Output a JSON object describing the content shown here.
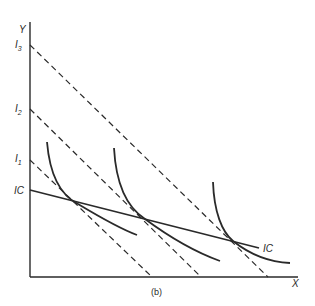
{
  "figure": {
    "caption": "(b)",
    "axes": {
      "y_label": "Y",
      "x_label": "X"
    },
    "budget_lines": [
      {
        "label": "I",
        "sub": "1",
        "y_intercept": 160,
        "x_intercept": 152
      },
      {
        "label": "I",
        "sub": "2",
        "y_intercept": 109,
        "x_intercept": 201
      },
      {
        "label": "I",
        "sub": "3",
        "y_intercept": 45,
        "x_intercept": 268
      }
    ],
    "ic_line": {
      "left_label": "IC",
      "right_label": "IC"
    },
    "indifference_curves": 3,
    "colors": {
      "ink": "#2a2a2a",
      "background": "#ffffff"
    }
  }
}
